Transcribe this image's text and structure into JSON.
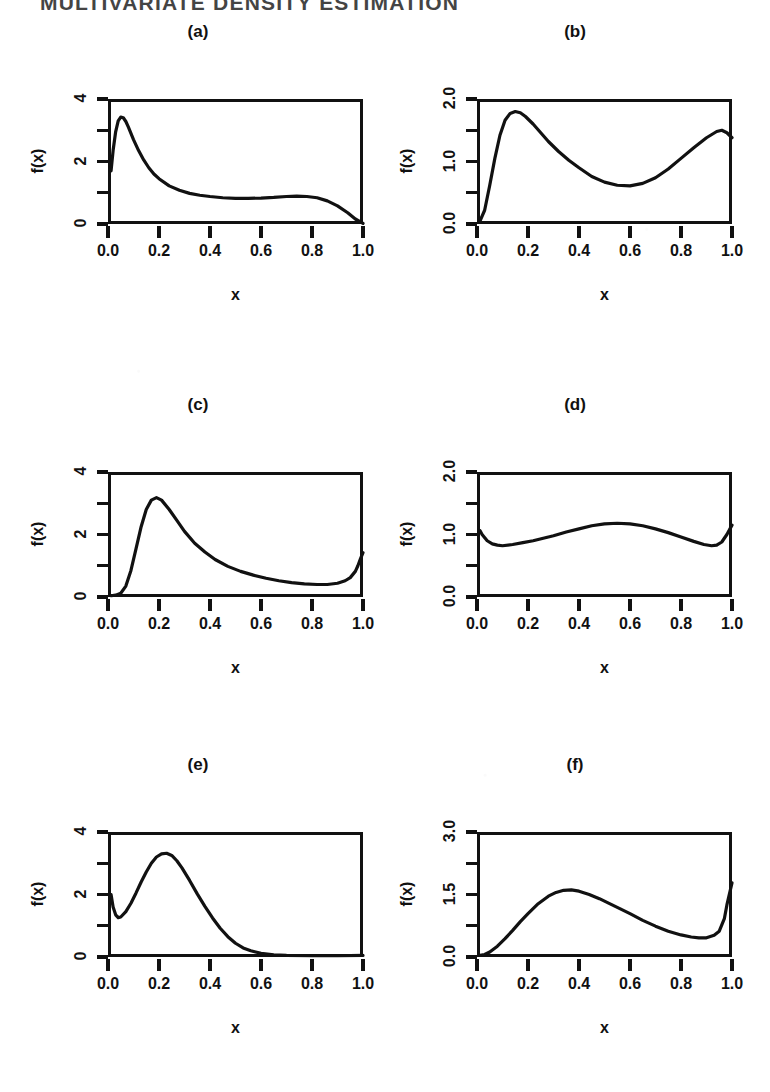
{
  "document": {
    "running_head": "MULTIVARIATE DENSITY ESTIMATION",
    "figure_label": "(a)-(f)"
  },
  "axis": {
    "xlabel": "x",
    "ylabel": "f(x)",
    "xticks": [
      "0.0",
      "0.2",
      "0.4",
      "0.6",
      "0.8",
      "1.0"
    ],
    "xtick_values": [
      0.0,
      0.2,
      0.4,
      0.6,
      0.8,
      1.0
    ],
    "xlim": [
      0.0,
      1.0
    ]
  },
  "colors": {
    "ink": "#111111",
    "paper": "#ffffff"
  },
  "chart_data": [
    {
      "type": "line",
      "panel": "a",
      "title": "(a)",
      "xlabel": "x",
      "ylabel": "f(x)",
      "xlim": [
        0.0,
        1.0
      ],
      "ylim": [
        0.0,
        4.0
      ],
      "yticks": [
        "0",
        "2",
        "4"
      ],
      "ytick_values": [
        0,
        2,
        4
      ],
      "yminor_values": [
        1,
        3
      ],
      "grid": false,
      "legend": "none",
      "x": [
        0.012,
        0.02,
        0.03,
        0.04,
        0.05,
        0.06,
        0.07,
        0.08,
        0.1,
        0.12,
        0.14,
        0.16,
        0.18,
        0.2,
        0.24,
        0.28,
        0.32,
        0.36,
        0.4,
        0.45,
        0.5,
        0.55,
        0.6,
        0.65,
        0.7,
        0.74,
        0.78,
        0.82,
        0.86,
        0.9,
        0.94,
        0.97,
        1.0
      ],
      "y": [
        1.7,
        2.35,
        2.95,
        3.3,
        3.42,
        3.4,
        3.28,
        3.1,
        2.7,
        2.35,
        2.05,
        1.8,
        1.6,
        1.45,
        1.22,
        1.08,
        0.98,
        0.92,
        0.88,
        0.84,
        0.82,
        0.82,
        0.83,
        0.85,
        0.88,
        0.89,
        0.88,
        0.84,
        0.74,
        0.58,
        0.36,
        0.16,
        0.02
      ]
    },
    {
      "type": "line",
      "panel": "b",
      "title": "(b)",
      "xlabel": "x",
      "ylabel": "f(x)",
      "xlim": [
        0.0,
        1.0
      ],
      "ylim": [
        0.0,
        2.0
      ],
      "yticks": [
        "0.0",
        "1.0",
        "2.0"
      ],
      "ytick_values": [
        0.0,
        1.0,
        2.0
      ],
      "yminor_values": [
        0.5,
        1.5
      ],
      "grid": false,
      "legend": "none",
      "x": [
        0.012,
        0.03,
        0.05,
        0.07,
        0.09,
        0.11,
        0.13,
        0.15,
        0.17,
        0.19,
        0.22,
        0.25,
        0.28,
        0.32,
        0.36,
        0.4,
        0.45,
        0.5,
        0.55,
        0.6,
        0.65,
        0.7,
        0.75,
        0.8,
        0.85,
        0.9,
        0.94,
        0.96,
        0.98,
        1.0
      ],
      "y": [
        0.05,
        0.22,
        0.62,
        1.05,
        1.42,
        1.66,
        1.77,
        1.8,
        1.78,
        1.72,
        1.6,
        1.46,
        1.32,
        1.16,
        1.02,
        0.9,
        0.76,
        0.67,
        0.62,
        0.61,
        0.65,
        0.74,
        0.88,
        1.05,
        1.22,
        1.38,
        1.48,
        1.5,
        1.46,
        1.38
      ]
    },
    {
      "type": "line",
      "panel": "c",
      "title": "(c)",
      "xlabel": "x",
      "ylabel": "f(x)",
      "xlim": [
        0.0,
        1.0
      ],
      "ylim": [
        0.0,
        4.0
      ],
      "yticks": [
        "0",
        "2",
        "4"
      ],
      "ytick_values": [
        0,
        2,
        4
      ],
      "yminor_values": [
        1,
        3
      ],
      "grid": false,
      "legend": "none",
      "x": [
        0.012,
        0.03,
        0.05,
        0.07,
        0.09,
        0.11,
        0.13,
        0.15,
        0.17,
        0.19,
        0.21,
        0.24,
        0.27,
        0.3,
        0.34,
        0.38,
        0.42,
        0.47,
        0.52,
        0.57,
        0.62,
        0.67,
        0.72,
        0.77,
        0.82,
        0.86,
        0.9,
        0.93,
        0.95,
        0.97,
        0.98,
        0.99,
        1.0
      ],
      "y": [
        0.04,
        0.06,
        0.12,
        0.35,
        0.85,
        1.55,
        2.25,
        2.8,
        3.1,
        3.18,
        3.1,
        2.8,
        2.45,
        2.1,
        1.72,
        1.44,
        1.2,
        0.98,
        0.82,
        0.7,
        0.6,
        0.52,
        0.46,
        0.42,
        0.4,
        0.4,
        0.44,
        0.52,
        0.62,
        0.82,
        1.0,
        1.22,
        1.42
      ]
    },
    {
      "type": "line",
      "panel": "d",
      "title": "(d)",
      "xlabel": "x",
      "ylabel": "f(x)",
      "xlim": [
        0.0,
        1.0
      ],
      "ylim": [
        0.0,
        2.0
      ],
      "yticks": [
        "0.0",
        "1.0",
        "2.0"
      ],
      "ytick_values": [
        0.0,
        1.0,
        2.0
      ],
      "yminor_values": [
        0.5,
        1.5
      ],
      "grid": false,
      "legend": "none",
      "x": [
        0.012,
        0.02,
        0.04,
        0.06,
        0.08,
        0.1,
        0.14,
        0.18,
        0.22,
        0.26,
        0.3,
        0.35,
        0.4,
        0.45,
        0.5,
        0.55,
        0.6,
        0.65,
        0.7,
        0.75,
        0.8,
        0.85,
        0.89,
        0.92,
        0.94,
        0.96,
        0.98,
        1.0
      ],
      "y": [
        1.06,
        1.0,
        0.9,
        0.85,
        0.83,
        0.82,
        0.84,
        0.87,
        0.9,
        0.94,
        0.98,
        1.04,
        1.09,
        1.14,
        1.17,
        1.18,
        1.17,
        1.14,
        1.09,
        1.03,
        0.96,
        0.89,
        0.84,
        0.82,
        0.83,
        0.88,
        1.0,
        1.15
      ]
    },
    {
      "type": "line",
      "panel": "e",
      "title": "(e)",
      "xlabel": "x",
      "ylabel": "f(x)",
      "xlim": [
        0.0,
        1.0
      ],
      "ylim": [
        0.0,
        4.0
      ],
      "yticks": [
        "0",
        "2",
        "4"
      ],
      "ytick_values": [
        0,
        2,
        4
      ],
      "yminor_values": [
        1,
        3
      ],
      "grid": false,
      "legend": "none",
      "x": [
        0.012,
        0.02,
        0.03,
        0.04,
        0.05,
        0.07,
        0.09,
        0.11,
        0.13,
        0.15,
        0.17,
        0.19,
        0.21,
        0.23,
        0.25,
        0.27,
        0.29,
        0.32,
        0.35,
        0.38,
        0.41,
        0.44,
        0.47,
        0.5,
        0.53,
        0.56,
        0.6,
        0.65,
        0.7,
        0.8,
        0.9,
        1.0
      ],
      "y": [
        2.0,
        1.6,
        1.35,
        1.26,
        1.28,
        1.45,
        1.72,
        2.05,
        2.4,
        2.72,
        3.0,
        3.2,
        3.3,
        3.32,
        3.25,
        3.08,
        2.85,
        2.45,
        2.02,
        1.62,
        1.25,
        0.92,
        0.65,
        0.44,
        0.29,
        0.2,
        0.12,
        0.07,
        0.05,
        0.04,
        0.04,
        0.05
      ]
    },
    {
      "type": "line",
      "panel": "f",
      "title": "(f)",
      "xlabel": "x",
      "ylabel": "f(x)",
      "xlim": [
        0.0,
        1.0
      ],
      "ylim": [
        0.0,
        3.0
      ],
      "yticks": [
        "0.0",
        "1.5",
        "3.0"
      ],
      "ytick_values": [
        0.0,
        1.5,
        3.0
      ],
      "yminor_values": [
        0.75,
        2.25
      ],
      "grid": false,
      "legend": "none",
      "x": [
        0.012,
        0.03,
        0.05,
        0.08,
        0.11,
        0.14,
        0.17,
        0.2,
        0.24,
        0.28,
        0.31,
        0.34,
        0.37,
        0.4,
        0.44,
        0.48,
        0.52,
        0.56,
        0.6,
        0.65,
        0.7,
        0.75,
        0.8,
        0.84,
        0.87,
        0.9,
        0.93,
        0.95,
        0.97,
        0.98,
        1.0
      ],
      "y": [
        0.04,
        0.06,
        0.12,
        0.26,
        0.44,
        0.64,
        0.85,
        1.04,
        1.28,
        1.46,
        1.55,
        1.6,
        1.61,
        1.58,
        1.5,
        1.4,
        1.28,
        1.16,
        1.04,
        0.88,
        0.74,
        0.62,
        0.53,
        0.48,
        0.46,
        0.46,
        0.52,
        0.62,
        0.92,
        1.25,
        1.78
      ]
    }
  ]
}
